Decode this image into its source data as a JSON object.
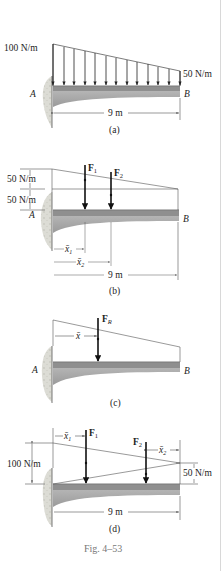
{
  "figure": {
    "caption": "Fig. 4–53",
    "colors": {
      "beam_top": "#8a8a8a",
      "beam_body": "#a9a9a9",
      "wall": "#d9d9d2",
      "line": "#222222",
      "thin_line": "#555555"
    }
  },
  "panel_a": {
    "label": "(a)",
    "load_left": "100 N/m",
    "load_right": "50 N/m",
    "point_a": "A",
    "point_b": "B",
    "length": "9 m"
  },
  "panel_b": {
    "label": "(b)",
    "upper_load": "50 N/m",
    "lower_load": "50 N/m",
    "point_a": "A",
    "point_b": "B",
    "force_1": "F",
    "force_1_sub": "1",
    "force_2": "F",
    "force_2_sub": "2",
    "x1": "x̄",
    "x1_sub": "1",
    "x2": "x̄",
    "x2_sub": "2",
    "length": "9 m"
  },
  "panel_c": {
    "label": "(c)",
    "point_a": "A",
    "point_b": "B",
    "force_r": "F",
    "force_r_sub": "R",
    "xbar": "x̄"
  },
  "panel_d": {
    "label": "(d)",
    "load_left": "100 N/m",
    "load_right": "50 N/m",
    "force_1": "F",
    "force_1_sub": "1",
    "force_2": "F",
    "force_2_sub": "2",
    "x1": "x̄",
    "x1_sub": "1",
    "x2": "x̄",
    "x2_sub": "2",
    "length": "9 m"
  }
}
